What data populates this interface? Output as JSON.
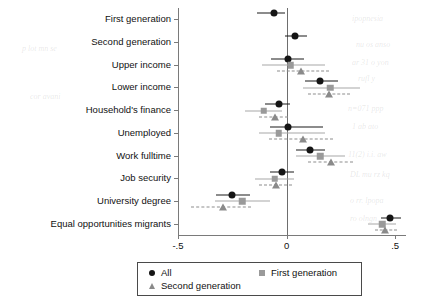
{
  "chart_data": {
    "type": "scatter",
    "title": "",
    "subtitle": "",
    "xlabel": "",
    "ylabel": "",
    "xlim": [
      -0.5,
      0.55
    ],
    "xticks": [
      -0.5,
      0,
      0.5
    ],
    "xticklabels": [
      "-.5",
      "0",
      ".5"
    ],
    "grid": false,
    "zero_reference_line": 0,
    "legend_position": "bottom-center",
    "orientation": "horizontal",
    "categories": [
      "First generation",
      "Second generation",
      "Upper income",
      "Lower income",
      "Household's finance",
      "Unemployed",
      "Work fulltime",
      "Job security",
      "University degree",
      "Equal opportunities migrants"
    ],
    "series": [
      {
        "name": "All",
        "marker": "circle",
        "color": "#151515",
        "linestyle": "solid",
        "values": [
          -0.06,
          0.04,
          0.005,
          0.155,
          -0.035,
          0.005,
          0.11,
          -0.02,
          -0.25,
          0.475
        ],
        "ci_low": [
          -0.135,
          -0.005,
          -0.07,
          0.085,
          -0.1,
          -0.075,
          0.045,
          -0.075,
          -0.325,
          0.435
        ],
        "ci_high": [
          -0.005,
          0.095,
          0.08,
          0.235,
          0.015,
          0.17,
          0.175,
          0.035,
          -0.17,
          0.525
        ]
      },
      {
        "name": "First generation",
        "marker": "square",
        "color": "#9a9a9a",
        "linestyle": "solid",
        "values": [
          null,
          null,
          0.02,
          0.2,
          -0.105,
          -0.035,
          0.155,
          -0.055,
          -0.205,
          0.44
        ],
        "ci_low": [
          null,
          null,
          -0.115,
          0.075,
          -0.19,
          -0.125,
          0.045,
          -0.145,
          -0.33,
          0.375
        ],
        "ci_high": [
          null,
          null,
          0.175,
          0.34,
          -0.02,
          0.175,
          0.27,
          0.035,
          -0.075,
          0.505
        ]
      },
      {
        "name": "Second generation",
        "marker": "triangle",
        "color": "#8a8a8a",
        "linestyle": "dashed",
        "values": [
          null,
          null,
          0.065,
          0.195,
          -0.055,
          0.075,
          0.205,
          -0.05,
          -0.295,
          0.455
        ],
        "ci_low": [
          null,
          null,
          -0.045,
          0.1,
          -0.125,
          -0.08,
          0.1,
          -0.125,
          -0.44,
          0.405
        ],
        "ci_high": [
          null,
          null,
          0.195,
          0.29,
          0.005,
          0.215,
          0.305,
          0.025,
          -0.165,
          0.51
        ]
      }
    ]
  },
  "legend": {
    "entries": [
      {
        "label": "All",
        "marker": "circle"
      },
      {
        "label": "First generation",
        "marker": "square"
      },
      {
        "label": "Second generation",
        "marker": "triangle"
      }
    ]
  },
  "ghost_marks": [
    {
      "text": "ipopnesia",
      "x": 352,
      "y": 14
    },
    {
      "text": "nu os anso",
      "x": 356,
      "y": 40
    },
    {
      "text": "ar 31 o yon",
      "x": 352,
      "y": 58
    },
    {
      "text": "rufl y ",
      "x": 358,
      "y": 74
    },
    {
      "text": "n=071 ppp",
      "x": 348,
      "y": 104
    },
    {
      "text": "1 ab ato",
      "x": 352,
      "y": 122
    },
    {
      "text": "11(2) i.i. aw",
      "x": 348,
      "y": 150
    },
    {
      "text": "DL mu rz kq",
      "x": 350,
      "y": 170
    },
    {
      "text": "o rr. lpopa",
      "x": 350,
      "y": 196
    },
    {
      "text": "ro olngn",
      "x": 350,
      "y": 214
    },
    {
      "text": "p lot mn se",
      "x": 22,
      "y": 44
    },
    {
      "text": "cor avani",
      "x": 30,
      "y": 92
    }
  ]
}
